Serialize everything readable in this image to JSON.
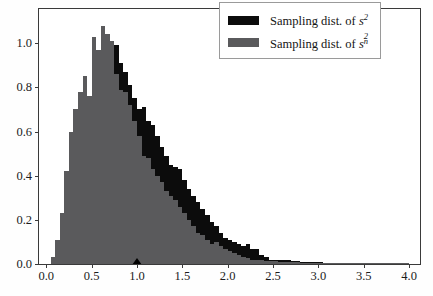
{
  "chart_data": {
    "type": "bar",
    "subtype": "overlaid-histogram",
    "title": "",
    "xlabel": "",
    "ylabel": "",
    "xlim": [
      -0.08,
      4.12
    ],
    "ylim": [
      0.0,
      1.155
    ],
    "grid": false,
    "bin_width": 0.05,
    "legend_position": "upper right",
    "legend": [
      {
        "label_text": "Sampling dist. of ",
        "symbol_base": "s",
        "symbol_sup": "2",
        "symbol_sub": "",
        "color": "#0c0c0c"
      },
      {
        "label_text": "Sampling dist. of ",
        "symbol_base": "s",
        "symbol_sup": "2",
        "symbol_sub": "n",
        "color": "#5a5a5c"
      }
    ],
    "xticks": [
      0.0,
      0.5,
      1.0,
      1.5,
      2.0,
      2.5,
      3.0,
      3.5,
      4.0
    ],
    "xtick_labels": [
      "0.0",
      "0.5",
      "1.0",
      "1.5",
      "2.0",
      "2.5",
      "3.0",
      "3.5",
      "4.0"
    ],
    "yticks": [
      0.0,
      0.2,
      0.4,
      0.6,
      0.8,
      1.0
    ],
    "ytick_labels": [
      "0.0",
      "0.2",
      "0.4",
      "0.6",
      "0.8",
      "1.0"
    ],
    "annotations": [
      {
        "name": "true-variance-marker",
        "x": 1.0,
        "y": 0.0,
        "shape": "triangle",
        "color": "#000000"
      }
    ],
    "series": [
      {
        "name": "Sampling dist. of s^2",
        "color": "#0c0c0c",
        "x": [
          0.075,
          0.125,
          0.175,
          0.225,
          0.275,
          0.325,
          0.375,
          0.425,
          0.475,
          0.525,
          0.575,
          0.625,
          0.675,
          0.725,
          0.775,
          0.825,
          0.875,
          0.925,
          0.975,
          1.025,
          1.075,
          1.125,
          1.175,
          1.225,
          1.275,
          1.325,
          1.375,
          1.425,
          1.475,
          1.525,
          1.575,
          1.625,
          1.675,
          1.725,
          1.775,
          1.825,
          1.875,
          1.925,
          1.975,
          2.025,
          2.075,
          2.125,
          2.175,
          2.225,
          2.275,
          2.325,
          2.375,
          2.425,
          2.475,
          2.525,
          2.575,
          2.625,
          2.675,
          2.725,
          2.775,
          2.825,
          2.875,
          2.925,
          2.975,
          3.025,
          3.075,
          3.125,
          3.175,
          3.225,
          3.275,
          3.325,
          3.375,
          3.425,
          3.475,
          3.525,
          3.575,
          3.625,
          3.675,
          3.725,
          3.775,
          3.825,
          3.875,
          3.925,
          3.975
        ],
        "values": [
          0.01,
          0.03,
          0.09,
          0.2,
          0.36,
          0.49,
          0.6,
          0.68,
          0.76,
          0.86,
          0.95,
          0.97,
          1.03,
          1.0,
          0.99,
          0.91,
          0.87,
          0.81,
          0.75,
          0.7,
          0.71,
          0.65,
          0.63,
          0.58,
          0.53,
          0.49,
          0.45,
          0.44,
          0.43,
          0.38,
          0.34,
          0.31,
          0.28,
          0.25,
          0.22,
          0.19,
          0.17,
          0.14,
          0.12,
          0.11,
          0.1,
          0.09,
          0.08,
          0.09,
          0.07,
          0.07,
          0.04,
          0.03,
          0.02,
          0.02,
          0.02,
          0.02,
          0.02,
          0.015,
          0.012,
          0.01,
          0.01,
          0.008,
          0.008,
          0.008,
          0.006,
          0.006,
          0.006,
          0.005,
          0.005,
          0.005,
          0.004,
          0.004,
          0.004,
          0.004,
          0.004,
          0.004,
          0.003,
          0.003,
          0.003,
          0.005,
          0.006,
          0.004,
          0.003
        ]
      },
      {
        "name": "Sampling dist. of s_n^2",
        "color": "#5a5a5c",
        "x": [
          0.075,
          0.125,
          0.175,
          0.225,
          0.275,
          0.325,
          0.375,
          0.425,
          0.475,
          0.525,
          0.575,
          0.625,
          0.675,
          0.725,
          0.775,
          0.825,
          0.875,
          0.925,
          0.975,
          1.025,
          1.075,
          1.125,
          1.175,
          1.225,
          1.275,
          1.325,
          1.375,
          1.425,
          1.475,
          1.525,
          1.575,
          1.625,
          1.675,
          1.725,
          1.775,
          1.825,
          1.875,
          1.925,
          1.975,
          2.025,
          2.075,
          2.125,
          2.175,
          2.225,
          2.275,
          2.325,
          2.375,
          2.425,
          2.475,
          2.525,
          2.575,
          2.625,
          2.675,
          2.725,
          2.775,
          2.825,
          2.875,
          2.925,
          2.975,
          3.025,
          3.075,
          3.125,
          3.175,
          3.225,
          3.275,
          3.325,
          3.375,
          3.425,
          3.475,
          3.525,
          3.575,
          3.625,
          3.675,
          3.725,
          3.775,
          3.825,
          3.875,
          3.925,
          3.975
        ],
        "values": [
          0.03,
          0.11,
          0.23,
          0.42,
          0.6,
          0.7,
          0.78,
          0.85,
          0.76,
          1.03,
          0.97,
          1.08,
          1.04,
          1.01,
          0.86,
          0.79,
          0.78,
          0.72,
          0.65,
          0.58,
          0.49,
          0.48,
          0.43,
          0.4,
          0.37,
          0.33,
          0.31,
          0.29,
          0.26,
          0.23,
          0.2,
          0.17,
          0.14,
          0.13,
          0.11,
          0.09,
          0.1,
          0.08,
          0.07,
          0.06,
          0.05,
          0.04,
          0.03,
          0.025,
          0.02,
          0.02,
          0.018,
          0.015,
          0.012,
          0.012,
          0.01,
          0.01,
          0.01,
          0.008,
          0.008,
          0.006,
          0.006,
          0.006,
          0.005,
          0.005,
          0.005,
          0.004,
          0.004,
          0.004,
          0.004,
          0.003,
          0.003,
          0.003,
          0.003,
          0.003,
          0.003,
          0.003,
          0.002,
          0.002,
          0.002,
          0.003,
          0.004,
          0.003,
          0.002
        ]
      }
    ]
  }
}
